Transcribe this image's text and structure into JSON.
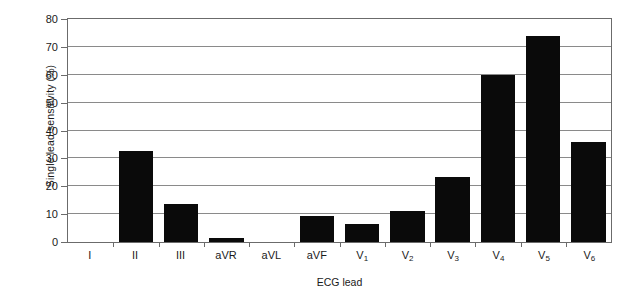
{
  "chart_data": {
    "type": "bar",
    "title": "",
    "xlabel": "ECG lead",
    "ylabel": "Single lead sensitivity (%)",
    "categories": [
      "I",
      "II",
      "III",
      "aVR",
      "aVL",
      "aVF",
      "V1",
      "V2",
      "V3",
      "V4",
      "V5",
      "V6"
    ],
    "category_labels_html": [
      "I",
      "II",
      "III",
      "aVR",
      "aVL",
      "aVF",
      "V<sub>1</sub>",
      "V<sub>2</sub>",
      "V<sub>3</sub>",
      "V<sub>4</sub>",
      "V<sub>5</sub>",
      "V<sub>6</sub>"
    ],
    "values": [
      0,
      32.5,
      13.5,
      1.5,
      0,
      9.5,
      6.5,
      11,
      23.5,
      60,
      74,
      36
    ],
    "ylim": [
      0,
      80
    ],
    "ytick_values": [
      0,
      10,
      20,
      30,
      40,
      50,
      60,
      70,
      80
    ],
    "ytick_labels": [
      "0",
      "10",
      "20",
      "30",
      "40",
      "50",
      "60",
      "70",
      "80"
    ],
    "grid": "horizontal",
    "legend": "none",
    "bar_color": "#0a0a0a",
    "axis_color": "#6b6b6b",
    "grid_color": "#8a8a8a"
  }
}
